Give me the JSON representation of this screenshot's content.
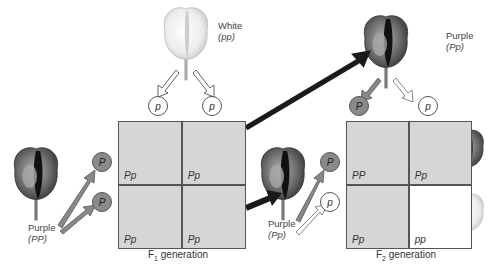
{
  "parents": {
    "white": {
      "label": "White",
      "genotype": "(pp)"
    },
    "purple_left": {
      "label": "Purple",
      "genotype": "(PP)"
    }
  },
  "f1": {
    "title_prefix": "F",
    "title_sub": "1",
    "title_suffix": " generation",
    "gametes_top": [
      "p",
      "p"
    ],
    "gametes_left": [
      "P",
      "P"
    ],
    "cells": [
      {
        "genotype": "Pp",
        "phenotype": "purple"
      },
      {
        "genotype": "Pp",
        "phenotype": "purple"
      },
      {
        "genotype": "Pp",
        "phenotype": "purple"
      },
      {
        "genotype": "Pp",
        "phenotype": "purple"
      }
    ]
  },
  "f1_parents": {
    "top": {
      "label": "Purple",
      "genotype": "(Pp)"
    },
    "left": {
      "label": "Purple",
      "genotype": "(Pp)"
    }
  },
  "f2": {
    "title_prefix": "F",
    "title_sub": "2",
    "title_suffix": " generation",
    "gametes_top": [
      "P",
      "p"
    ],
    "gametes_left": [
      "P",
      "p"
    ],
    "cells": [
      {
        "genotype": "PP",
        "phenotype": "purple"
      },
      {
        "genotype": "Pp",
        "phenotype": "purple"
      },
      {
        "genotype": "Pp",
        "phenotype": "purple"
      },
      {
        "genotype": "pp",
        "phenotype": "white"
      }
    ]
  },
  "colors": {
    "purple_flower": "#6a6a6a",
    "white_flower": "#f2f2f2",
    "cell_bg": "#d6d6d6",
    "dominant_allele": "#8a8a8a",
    "arrow": "#1a1a1a"
  }
}
